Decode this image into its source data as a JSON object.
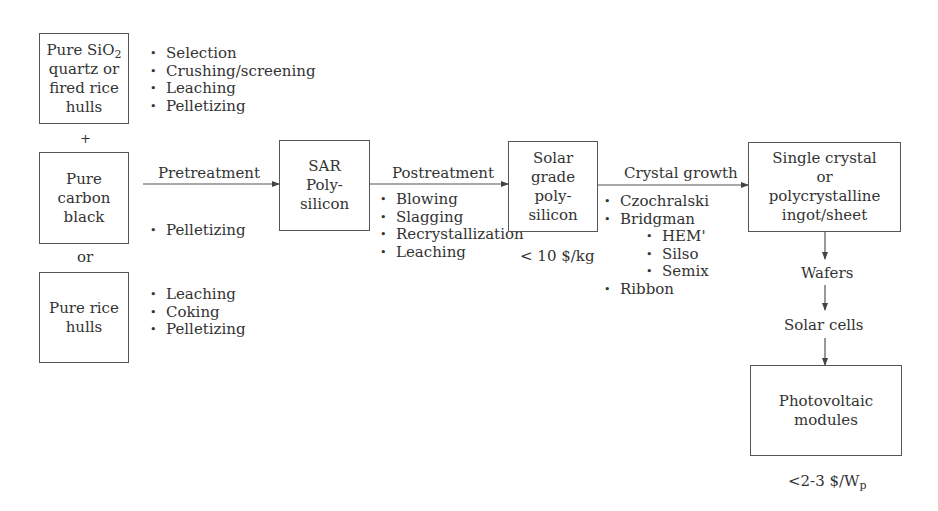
{
  "diagram": {
    "boxes": {
      "sio2": {
        "line1_prefix": "Pure SiO",
        "line1_sub": "2",
        "line2": "quartz or",
        "line3": "fired rice",
        "line4": "hulls"
      },
      "carbon": {
        "line1": "Pure",
        "line2": "carbon",
        "line3": "black"
      },
      "rice": {
        "line1": "Pure rice",
        "line2": "hulls"
      },
      "sar": {
        "line1": "SAR",
        "line2": "Poly-",
        "line3": "silicon"
      },
      "solar_grade": {
        "line1": "Solar",
        "line2": "grade",
        "line3": "poly-",
        "line4": "silicon"
      },
      "ingot": {
        "line1": "Single crystal",
        "line2": "or",
        "line3": "polycrystalline",
        "line4": "ingot/sheet"
      },
      "pv": {
        "line1": "Photovoltaic",
        "line2": "modules"
      }
    },
    "connectors": {
      "plus": "+",
      "or": "or"
    },
    "steps": {
      "pretreatment": "Pretreatment",
      "postreatment": "Postreatment",
      "crystal_growth": "Crystal growth",
      "wafers": "Wafers",
      "solar_cells": "Solar cells"
    },
    "lists": {
      "sio2_processes": [
        "Selection",
        "Crushing/screening",
        "Leaching",
        "Pelletizing"
      ],
      "carbon_processes": [
        "Pelletizing"
      ],
      "rice_processes": [
        "Leaching",
        "Coking",
        "Pelletizing"
      ],
      "postreatment_processes": [
        "Blowing",
        "Slagging",
        "Recrystallization",
        "Leaching"
      ],
      "crystal_growth_methods": [
        "Czochralski",
        "Bridgman"
      ],
      "bridgman_variants": [
        "HEM'",
        "Silso",
        "Semix"
      ],
      "crystal_growth_more": [
        "Ribbon"
      ]
    },
    "costs": {
      "solar_grade": "< 10 $/kg",
      "pv_prefix": "<2-3 $/W",
      "pv_sub": "p"
    }
  }
}
